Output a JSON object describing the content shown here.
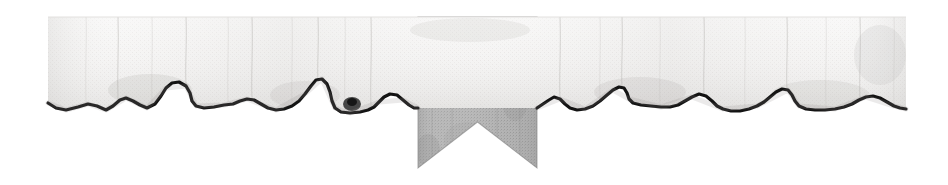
{
  "canvas": {
    "width": 948,
    "height": 185,
    "background_color": "#ffffff",
    "description": "Decorative chapter-header ornament: a horizontal strip of torn parchment paper with a hanging heraldic pennant bearing a cross pattée"
  },
  "paper_strip": {
    "name": "torn-paper-strip",
    "left": 48,
    "right": 906,
    "top": 17,
    "bottom_range": [
      85,
      117
    ],
    "fill_color": "#f0efee",
    "shade_color": "#dcdbd9",
    "torn_edge_color": "#1a1a1a",
    "texture": "halftone-dither",
    "top_edge": "straight",
    "bottom_edge": "torn-ragged",
    "crease_count": 9
  },
  "banner": {
    "name": "heraldic-pennant",
    "left": 418,
    "right": 537,
    "top": 17,
    "notch_apex_y": 122,
    "tail_bottom_y": 168,
    "fill_color": "#aeaeae",
    "fill_color_light": "#c4c4c4",
    "fill_color_dark": "#9a9a9a",
    "shape": "swallowtail",
    "texture": "halftone-dither"
  },
  "emblem": {
    "name": "cross-pattee",
    "label": "Cross Pattée",
    "center_x": 467,
    "center_y": 64,
    "width": 42,
    "height": 42,
    "color": "#111111",
    "style": "cross-pattee"
  },
  "torn_edge_points": [
    [
      48,
      103
    ],
    [
      56,
      108
    ],
    [
      66,
      110
    ],
    [
      78,
      107
    ],
    [
      88,
      104
    ],
    [
      97,
      106
    ],
    [
      106,
      110
    ],
    [
      113,
      106
    ],
    [
      120,
      100
    ],
    [
      126,
      98
    ],
    [
      133,
      101
    ],
    [
      140,
      105
    ],
    [
      147,
      108
    ],
    [
      155,
      104
    ],
    [
      161,
      96
    ],
    [
      166,
      88
    ],
    [
      172,
      83
    ],
    [
      179,
      82
    ],
    [
      186,
      86
    ],
    [
      190,
      93
    ],
    [
      192,
      101
    ],
    [
      196,
      106
    ],
    [
      204,
      108
    ],
    [
      214,
      107
    ],
    [
      224,
      105
    ],
    [
      233,
      104
    ],
    [
      240,
      101
    ],
    [
      247,
      99
    ],
    [
      254,
      100
    ],
    [
      261,
      104
    ],
    [
      268,
      108
    ],
    [
      276,
      110
    ],
    [
      284,
      109
    ],
    [
      292,
      106
    ],
    [
      299,
      101
    ],
    [
      305,
      94
    ],
    [
      311,
      86
    ],
    [
      316,
      80
    ],
    [
      322,
      79
    ],
    [
      327,
      84
    ],
    [
      330,
      92
    ],
    [
      332,
      101
    ],
    [
      335,
      108
    ],
    [
      341,
      112
    ],
    [
      350,
      113
    ],
    [
      360,
      112
    ],
    [
      368,
      110
    ],
    [
      374,
      107
    ],
    [
      379,
      102
    ],
    [
      384,
      97
    ],
    [
      390,
      94
    ],
    [
      397,
      95
    ],
    [
      403,
      100
    ],
    [
      409,
      105
    ],
    [
      414,
      108
    ],
    [
      418,
      108
    ],
    [
      537,
      108
    ],
    [
      543,
      104
    ],
    [
      549,
      100
    ],
    [
      554,
      97
    ],
    [
      560,
      99
    ],
    [
      565,
      104
    ],
    [
      570,
      108
    ],
    [
      577,
      110
    ],
    [
      585,
      109
    ],
    [
      593,
      106
    ],
    [
      600,
      101
    ],
    [
      607,
      95
    ],
    [
      613,
      90
    ],
    [
      619,
      87
    ],
    [
      624,
      88
    ],
    [
      627,
      93
    ],
    [
      629,
      99
    ],
    [
      633,
      103
    ],
    [
      641,
      105
    ],
    [
      651,
      106
    ],
    [
      661,
      107
    ],
    [
      670,
      107
    ],
    [
      678,
      105
    ],
    [
      685,
      101
    ],
    [
      692,
      97
    ],
    [
      699,
      94
    ],
    [
      706,
      96
    ],
    [
      712,
      101
    ],
    [
      717,
      106
    ],
    [
      723,
      109
    ],
    [
      731,
      111
    ],
    [
      740,
      111
    ],
    [
      749,
      109
    ],
    [
      757,
      106
    ],
    [
      764,
      102
    ],
    [
      770,
      97
    ],
    [
      776,
      92
    ],
    [
      782,
      89
    ],
    [
      788,
      90
    ],
    [
      792,
      95
    ],
    [
      795,
      101
    ],
    [
      799,
      106
    ],
    [
      806,
      109
    ],
    [
      815,
      110
    ],
    [
      825,
      110
    ],
    [
      835,
      109
    ],
    [
      844,
      107
    ],
    [
      852,
      104
    ],
    [
      859,
      100
    ],
    [
      866,
      97
    ],
    [
      873,
      96
    ],
    [
      880,
      98
    ],
    [
      887,
      102
    ],
    [
      894,
      106
    ],
    [
      900,
      108
    ],
    [
      906,
      109
    ]
  ],
  "creases": [
    {
      "x": 118,
      "y1": 17,
      "y2": 100
    },
    {
      "x": 186,
      "y1": 17,
      "y2": 84
    },
    {
      "x": 252,
      "y1": 17,
      "y2": 99
    },
    {
      "x": 318,
      "y1": 17,
      "y2": 81
    },
    {
      "x": 371,
      "y1": 17,
      "y2": 106
    },
    {
      "x": 560,
      "y1": 17,
      "y2": 98
    },
    {
      "x": 622,
      "y1": 17,
      "y2": 88
    },
    {
      "x": 704,
      "y1": 17,
      "y2": 95
    },
    {
      "x": 787,
      "y1": 17,
      "y2": 90
    },
    {
      "x": 860,
      "y1": 17,
      "y2": 101
    }
  ]
}
